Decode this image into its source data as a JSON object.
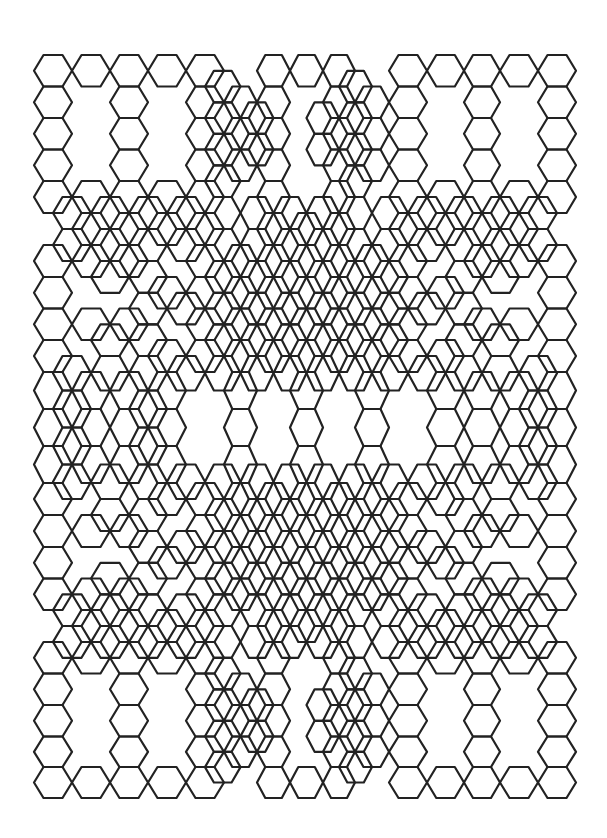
{
  "title": "Hexagon tiling pattern",
  "style": {
    "background": "#ffffff",
    "stroke": "#222222",
    "stroke_width": 2.2
  },
  "grid": {
    "col_edges": [
      34,
      72,
      110,
      148,
      186,
      224,
      257,
      290,
      323,
      355,
      389,
      427,
      464,
      500,
      538,
      576
    ],
    "row_edges": [
      55,
      86.5,
      118,
      149.5,
      181,
      213,
      245,
      277,
      308.5,
      340,
      372,
      409,
      446,
      483,
      515,
      547,
      578.5,
      610,
      642,
      673.5,
      705,
      736.5,
      767,
      798
    ]
  },
  "cells": {
    "legend": "X = hexagon centered in grid cell; . = empty",
    "rows": [
      "XXXXX.XXX.XXXXX",
      "X.X.XXX.XXX.X.X",
      "X.X.XXX.XXX.X.X",
      "X.X.XXX.XXX.X.X",
      "XXXXX.X.X.XXXXX",
      ".XXXX.XXX.XXXX.",
      "XXX.XXXXXXX.XXX",
      "X..XXXXXXXXX..X",
      "XXX.XXXXXXX.XXX",
      "X..XXXXXXXXX..X",
      "XXXX.X.X.X.XXXX",
      "XXXX.X.X.X.XXXX",
      "XXXX.X.X.X.XXXX",
      "X..XXXXXXXXX..X",
      "XXX.XXXXXXX.XXX",
      "X..XXXXXXXXX..X",
      "XXX.XXXXXXX.XXX",
      ".XXXX.XXX.XXXX.",
      "XXXXX.X.X.XXXXX",
      "X.X.XXX.XXX.X.X",
      "X.X.XXX.XXX.X.X",
      "X.X.XXX.XXX.X.X",
      "XXXXX.XXX.XXXXX"
    ]
  },
  "offset_cells": {
    "legend": "O = hexagon centered on a grid vertex (between col j/j+1 and row i/i+1); . = empty",
    "rows": [
      "....O...O.....",
      "....OO.OO.....",
      "....OO.OO.....",
      "....O...O.....",
      "OOOOOOOOOOOOOO",
      "OOOOOOOOOOOOOO",
      ".OO.OOOOOO.OO.",
      "..OOOOOOOOOO..",
      ".OO.OOOOOO.OO.",
      "OOOOOOOOOOOOOO",
      "O.O..........O",
      "O.O..........O",
      "OOOOOOOOOOOOOO",
      ".OO.OOOOOO.OO.",
      "..OOOOOOOOOO..",
      ".OO.OOOOOO.OO.",
      "OOOOOOOOOOOOOO",
      "OOOOOOOOOOOOOO",
      "....O...O.....",
      "....OO.OO.....",
      "....OO.OO.....",
      "....O...O....."
    ]
  }
}
